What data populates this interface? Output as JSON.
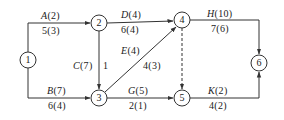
{
  "diagram": {
    "type": "activity-on-arrow network",
    "nodes": [
      {
        "id": "1",
        "label": "1",
        "x": 28,
        "y": 60
      },
      {
        "id": "2",
        "label": "2",
        "x": 99,
        "y": 23
      },
      {
        "id": "3",
        "label": "3",
        "x": 99,
        "y": 98
      },
      {
        "id": "4",
        "label": "4",
        "x": 182,
        "y": 20
      },
      {
        "id": "5",
        "label": "5",
        "x": 182,
        "y": 98
      },
      {
        "id": "6",
        "label": "6",
        "x": 259,
        "y": 63
      }
    ],
    "edges": [
      {
        "from": "1",
        "to": "2",
        "activity": "A",
        "duration": "(2)",
        "top": "A(2)",
        "bottom": "5(3)",
        "dashed": false
      },
      {
        "from": "1",
        "to": "3",
        "activity": "B",
        "duration": "(7)",
        "top": "B(7)",
        "bottom": "6(4)",
        "dashed": false
      },
      {
        "from": "2",
        "to": "3",
        "activity": "C",
        "duration": "(7)",
        "top": "C(7)",
        "bottom": "1",
        "dashed": false
      },
      {
        "from": "2",
        "to": "4",
        "activity": "D",
        "duration": "(4)",
        "top": "D(4)",
        "bottom": "6(4)",
        "dashed": false
      },
      {
        "from": "3",
        "to": "4",
        "activity": "E",
        "duration": "(4)",
        "top": "E(4)",
        "bottom": "4(3)",
        "dashed": false
      },
      {
        "from": "3",
        "to": "5",
        "activity": "G",
        "duration": "(5)",
        "top": "G(5)",
        "bottom": "2(1)",
        "dashed": false
      },
      {
        "from": "4",
        "to": "5",
        "activity": "dummy",
        "top": "",
        "bottom": "",
        "dashed": true
      },
      {
        "from": "4",
        "to": "6",
        "activity": "H",
        "duration": "(10)",
        "top": "H(10)",
        "bottom": "7(6)",
        "dashed": false
      },
      {
        "from": "5",
        "to": "6",
        "activity": "K",
        "duration": "(2)",
        "top": "K(2)",
        "bottom": "4(2)",
        "dashed": false
      }
    ]
  },
  "labels": {
    "A": {
      "name": "A",
      "dur": "(2)",
      "sub": "5(3)"
    },
    "B": {
      "name": "B",
      "dur": "(7)",
      "sub": "6(4)"
    },
    "C": {
      "name": "C",
      "dur": "(7)",
      "sub": "1"
    },
    "D": {
      "name": "D",
      "dur": "(4)",
      "sub": "6(4)"
    },
    "E": {
      "name": "E",
      "dur": "(4)",
      "sub": "4(3)"
    },
    "G": {
      "name": "G",
      "dur": "(5)",
      "sub": "2(1)"
    },
    "H": {
      "name": "H",
      "dur": "(10)",
      "sub": "7(6)"
    },
    "K": {
      "name": "K",
      "dur": "(2)",
      "sub": "4(2)"
    }
  },
  "colors": {
    "line": "#333333",
    "text": "#222222",
    "background": "#ffffff"
  }
}
